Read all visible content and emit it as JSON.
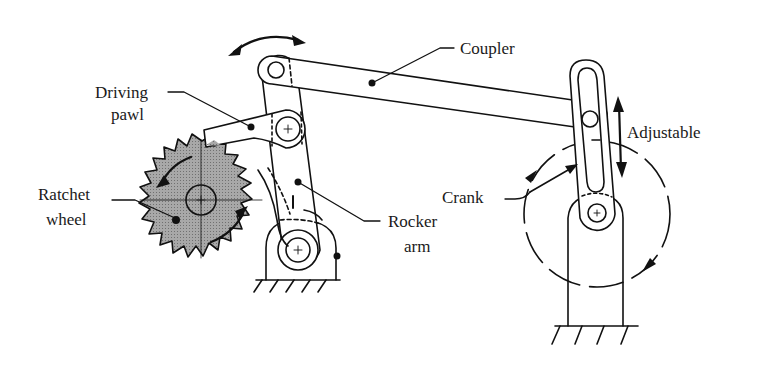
{
  "diagram": {
    "labels": {
      "coupler": "Coupler",
      "driving_pawl_1": "Driving",
      "driving_pawl_2": "pawl",
      "ratchet_wheel_1": "Ratchet",
      "ratchet_wheel_2": "wheel",
      "rocker_arm_1": "Rocker",
      "rocker_arm_2": "arm",
      "crank": "Crank",
      "adjustable": "Adjustable"
    },
    "colors": {
      "line": "#111111",
      "wheel_fill": "#9a9a9a",
      "background": "#ffffff"
    },
    "components": [
      "ratchet-wheel",
      "driving-pawl",
      "rocker-arm",
      "coupler",
      "crank",
      "adjustable-slot",
      "ground-supports"
    ]
  }
}
